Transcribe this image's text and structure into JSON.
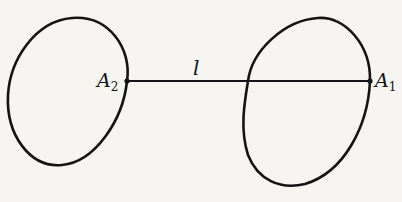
{
  "diagram": {
    "line_label": "l",
    "points": [
      {
        "name": "A",
        "subscript": "2"
      },
      {
        "name": "A",
        "subscript": "1"
      }
    ],
    "stroke_color": "#141414",
    "background_color": "#f6f5f2"
  }
}
